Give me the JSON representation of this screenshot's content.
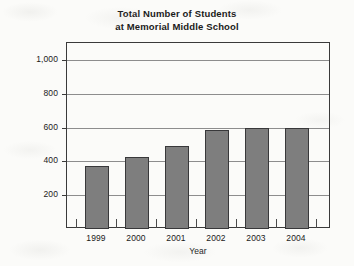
{
  "chart_data": {
    "type": "bar",
    "title": "Total Number of Students at Memorial Middle School",
    "title_line1": "Total Number of Students",
    "title_line2": "at Memorial Middle School",
    "xlabel": "Year",
    "ylabel": "Number of Students",
    "categories": [
      "1999",
      "2000",
      "2001",
      "2002",
      "2003",
      "2004"
    ],
    "values": [
      375,
      425,
      490,
      585,
      600,
      600
    ],
    "ylim": [
      0,
      1100
    ],
    "yticks": [
      200,
      400,
      600,
      800,
      1000
    ],
    "ytick_labels": [
      "200",
      "400",
      "600",
      "800",
      "1,000"
    ],
    "grid": true,
    "legend": "none",
    "bar_color": "#7e7e7e",
    "bar_edge_color": "#38383a",
    "gridline_color": "#8d8d8d",
    "frame_color": "#3a3a3a",
    "background_color": "#fbfbf9"
  }
}
